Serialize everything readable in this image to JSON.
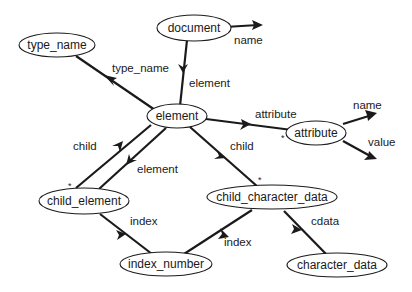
{
  "diagram": {
    "type": "schema-graph",
    "nodes": [
      {
        "id": "document",
        "label": "document"
      },
      {
        "id": "type_name",
        "label": "type_name"
      },
      {
        "id": "element",
        "label": "element"
      },
      {
        "id": "attribute",
        "label": "attribute"
      },
      {
        "id": "child_element",
        "label": "child_element"
      },
      {
        "id": "child_character_data",
        "label": "child_character_data"
      },
      {
        "id": "index_number",
        "label": "index_number"
      },
      {
        "id": "character_data",
        "label": "character_data"
      }
    ],
    "edges": [
      {
        "from": "document",
        "to": "(leaf)",
        "label": "name"
      },
      {
        "from": "document",
        "to": "element",
        "label": "element"
      },
      {
        "from": "element",
        "to": "type_name",
        "label": "type_name"
      },
      {
        "from": "element",
        "to": "attribute",
        "label": "attribute",
        "multiplicity": "*"
      },
      {
        "from": "attribute",
        "to": "(leaf)",
        "label": "name"
      },
      {
        "from": "attribute",
        "to": "(leaf)",
        "label": "value"
      },
      {
        "from": "element",
        "to": "child_element",
        "label": "child",
        "multiplicity": "*"
      },
      {
        "from": "child_element",
        "to": "element",
        "label": "element"
      },
      {
        "from": "element",
        "to": "child_character_data",
        "label": "child",
        "multiplicity": "*"
      },
      {
        "from": "child_element",
        "to": "index_number",
        "label": "index"
      },
      {
        "from": "child_character_data",
        "to": "index_number",
        "label": "index"
      },
      {
        "from": "child_character_data",
        "to": "character_data",
        "label": "cdata"
      }
    ],
    "multiplicity_mark": "*"
  }
}
